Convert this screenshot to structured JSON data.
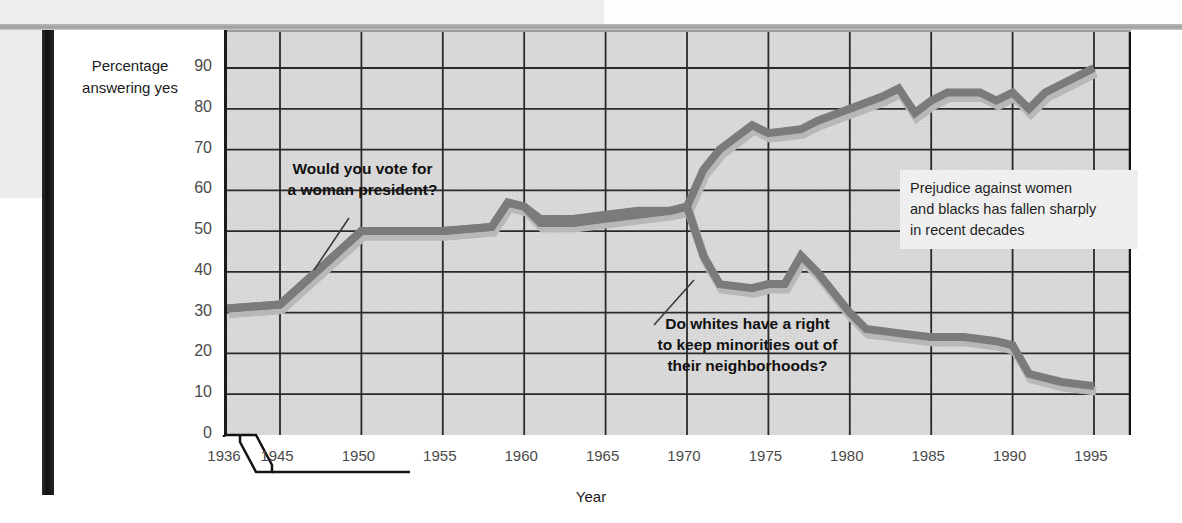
{
  "axes": {
    "y_title_line1": "Percentage",
    "y_title_line2": "answering yes",
    "x_title": "Year"
  },
  "annotations": {
    "women": {
      "line1": "Would you vote for",
      "line2": "a woman president?"
    },
    "whites": {
      "line1": "Do whites have a right",
      "line2": "to keep minorities out of",
      "line3": "their neighborhoods?"
    },
    "callout": {
      "line1": "Prejudice against women",
      "line2": "and blacks has fallen sharply",
      "line3": "in recent decades"
    }
  },
  "colors": {
    "line": "#7b7b7b",
    "line_shadow": "#b8b8b8",
    "plot_background": "#d9d9d9",
    "grid": "#2a2a2a",
    "axis": "#141414",
    "callout_background": "#efefef",
    "spine": "#161616"
  },
  "chart_data": {
    "type": "line",
    "title": "",
    "xlabel": "Year",
    "ylabel": "Percentage answering yes",
    "xlim": [
      1936,
      1996
    ],
    "ylim": [
      0,
      95
    ],
    "yticks": [
      0,
      10,
      20,
      30,
      40,
      50,
      60,
      70,
      80,
      90
    ],
    "xticks": [
      1936,
      1945,
      1950,
      1955,
      1960,
      1965,
      1970,
      1975,
      1980,
      1985,
      1990,
      1995
    ],
    "x_axis_break": "between 1936 and 1945",
    "grid": true,
    "legend": "none (inline annotations)",
    "series": [
      {
        "name": "Would you vote for a woman president?",
        "points": [
          [
            1936,
            31
          ],
          [
            1945,
            32
          ],
          [
            1950,
            50
          ],
          [
            1955,
            50
          ],
          [
            1958,
            51
          ],
          [
            1959,
            57
          ],
          [
            1960,
            56
          ],
          [
            1961,
            53
          ],
          [
            1963,
            53
          ],
          [
            1965,
            54
          ],
          [
            1967,
            55
          ],
          [
            1969,
            55
          ],
          [
            1970,
            56
          ],
          [
            1971,
            65
          ],
          [
            1972,
            70
          ],
          [
            1974,
            76
          ],
          [
            1975,
            74
          ],
          [
            1977,
            75
          ],
          [
            1978,
            77
          ],
          [
            1980,
            80
          ],
          [
            1982,
            83
          ],
          [
            1983,
            85
          ],
          [
            1984,
            79
          ],
          [
            1985,
            82
          ],
          [
            1986,
            84
          ],
          [
            1988,
            84
          ],
          [
            1989,
            82
          ],
          [
            1990,
            84
          ],
          [
            1991,
            80
          ],
          [
            1992,
            84
          ],
          [
            1993,
            86
          ],
          [
            1994,
            88
          ],
          [
            1995,
            90
          ]
        ]
      },
      {
        "name": "Do whites have a right to keep minorities out of their neighborhoods?",
        "points": [
          [
            1936,
            31
          ],
          [
            1945,
            32
          ],
          [
            1950,
            50
          ],
          [
            1955,
            50
          ],
          [
            1958,
            51
          ],
          [
            1959,
            57
          ],
          [
            1960,
            56
          ],
          [
            1961,
            52
          ],
          [
            1963,
            52
          ],
          [
            1965,
            53
          ],
          [
            1967,
            54
          ],
          [
            1969,
            55
          ],
          [
            1970,
            56
          ],
          [
            1971,
            44
          ],
          [
            1972,
            37
          ],
          [
            1974,
            36
          ],
          [
            1975,
            37
          ],
          [
            1976,
            37
          ],
          [
            1977,
            44
          ],
          [
            1978,
            40
          ],
          [
            1980,
            30
          ],
          [
            1981,
            26
          ],
          [
            1983,
            25
          ],
          [
            1985,
            24
          ],
          [
            1987,
            24
          ],
          [
            1989,
            23
          ],
          [
            1990,
            22
          ],
          [
            1991,
            15
          ],
          [
            1993,
            13
          ],
          [
            1995,
            12
          ]
        ]
      }
    ]
  }
}
